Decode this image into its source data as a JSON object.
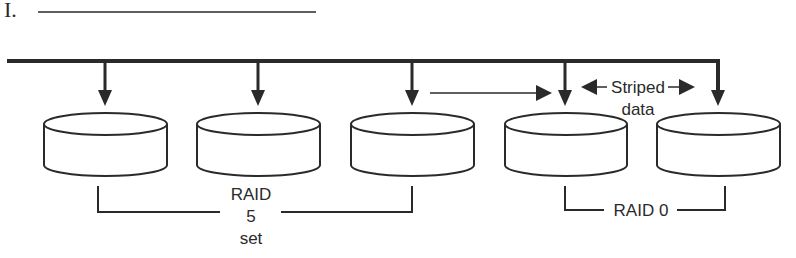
{
  "question": {
    "number": "I.",
    "answer_blank": ""
  },
  "diagram": {
    "title": "",
    "bus": {
      "label": ""
    },
    "disks": [
      {
        "id": "disk-1",
        "group": "RAID 5"
      },
      {
        "id": "disk-2",
        "group": "RAID 5"
      },
      {
        "id": "disk-3",
        "group": "RAID 5"
      },
      {
        "id": "disk-4",
        "group": "RAID 0"
      },
      {
        "id": "disk-5",
        "group": "RAID 0"
      }
    ],
    "labels": {
      "striped_line1": "Striped",
      "striped_line2": "data",
      "raid5_line1": "RAID",
      "raid5_line2": "5",
      "raid5_line3": "set",
      "raid0": "RAID 0"
    },
    "colors": {
      "stroke": "#2a2a2a",
      "background": "#ffffff"
    }
  }
}
